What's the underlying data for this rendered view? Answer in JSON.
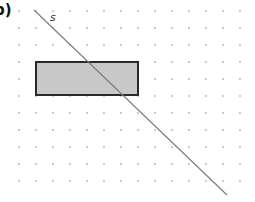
{
  "figure": {
    "part_label": "b)",
    "line_label": "s",
    "colors": {
      "background": "#ffffff",
      "grid_dot": "#b4b4b4",
      "line": "#7a7a7a",
      "rect_fill": "#c8c8c8",
      "rect_stroke": "#2a2a2a"
    },
    "grid": {
      "x0": 19,
      "y0": 11,
      "spacing": 17,
      "cols": 14,
      "rows": 11,
      "dot_radius": 0.9
    },
    "line": {
      "x1": 34,
      "y1": 10,
      "x2": 227,
      "y2": 195
    },
    "rectangle": {
      "x": 36,
      "y": 62,
      "width": 102,
      "height": 33
    }
  }
}
